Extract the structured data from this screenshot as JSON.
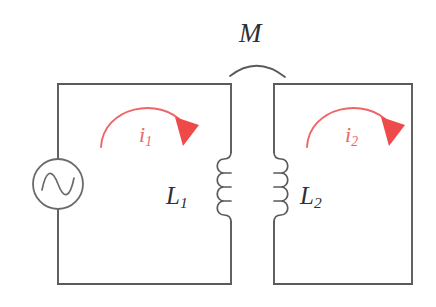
{
  "figure": {
    "background_color": "#ffffff",
    "width": 436,
    "height": 307
  },
  "colors": {
    "wire": "#5a5a5a",
    "label_dark": "#2f2f35",
    "current_red": "#ef6565",
    "arrowhead_red": "#ef4a4a"
  },
  "labels": {
    "mutual_inductance": "M",
    "inductor_left_symbol": "L",
    "inductor_left_subscript": "1",
    "inductor_right_symbol": "L",
    "inductor_right_subscript": "2",
    "current_left_symbol": "i",
    "current_left_subscript": "1",
    "current_right_symbol": "i",
    "current_right_subscript": "2"
  },
  "components": {
    "ac_source": {
      "name": "ac-voltage-source",
      "shape": "circle-with-sine",
      "center_x": 58,
      "center_y": 184,
      "radius": 25
    },
    "inductor_left": {
      "name": "inductor-L1",
      "turns": 4,
      "orientation": "vertical",
      "bulge_direction": "left",
      "x": 231,
      "y_top": 152,
      "y_bottom": 222
    },
    "inductor_right": {
      "name": "inductor-L2",
      "turns": 4,
      "orientation": "vertical",
      "bulge_direction": "right",
      "x": 274,
      "y_top": 152,
      "y_bottom": 222
    },
    "coupling_arc": {
      "name": "mutual-coupling-arc",
      "x_start": 230,
      "x_end": 285,
      "peak_y": 59
    }
  },
  "loops": {
    "left": {
      "name": "primary-loop",
      "x_left": 58,
      "x_right": 231,
      "y_top": 84,
      "y_bottom": 284
    },
    "right": {
      "name": "secondary-loop",
      "x_left": 274,
      "x_right": 412,
      "y_top": 84,
      "y_bottom": 284
    }
  },
  "current_arrows": {
    "left": {
      "name": "current-arrow-i1",
      "direction": "clockwise",
      "color": "#ef6565"
    },
    "right": {
      "name": "current-arrow-i2",
      "direction": "clockwise",
      "color": "#ef6565"
    }
  }
}
